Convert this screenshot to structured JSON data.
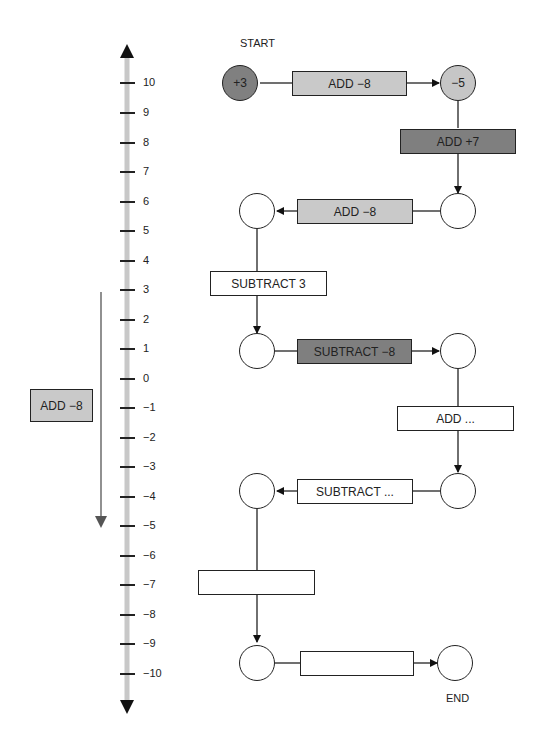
{
  "labels": {
    "start": "START",
    "end": "END"
  },
  "number_line": {
    "ticks": [
      "10",
      "9",
      "8",
      "7",
      "6",
      "5",
      "4",
      "3",
      "2",
      "1",
      "0",
      "−1",
      "−2",
      "−3",
      "−4",
      "−5",
      "−6",
      "−7",
      "−8",
      "−9",
      "−10"
    ],
    "side_box": "ADD −8",
    "side_arrow": {
      "from": 3,
      "to": -5
    }
  },
  "flow": {
    "nodes": [
      "+3",
      "−5",
      "",
      "",
      "",
      "",
      "",
      "",
      "",
      "",
      ""
    ],
    "steps": [
      {
        "label": "ADD −8",
        "style": "light"
      },
      {
        "label": "ADD +7",
        "style": "dark"
      },
      {
        "label": "ADD −8",
        "style": "light"
      },
      {
        "label": "SUBTRACT 3",
        "style": "white"
      },
      {
        "label": "SUBTRACT −8",
        "style": "dark"
      },
      {
        "label": "ADD ...",
        "style": "white"
      },
      {
        "label": "SUBTRACT ...",
        "style": "white"
      },
      {
        "label": "",
        "style": "white"
      },
      {
        "label": "",
        "style": "white"
      }
    ]
  },
  "colors": {
    "dark": "#7f7f7f",
    "light": "#c9c9c9",
    "axis": "#c8c8c8",
    "line": "#222222"
  }
}
